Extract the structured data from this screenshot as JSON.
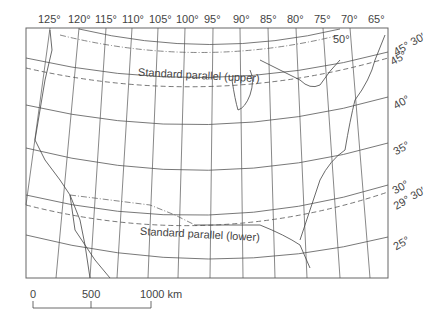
{
  "map": {
    "title": "Albers equal-area conic projection of the conterminous United States",
    "longitude_labels": [
      "125°",
      "120°",
      "115°",
      "110°",
      "105°",
      "100°",
      "95°",
      "90°",
      "85°",
      "80°",
      "75°",
      "70°",
      "65°"
    ],
    "latitude_labels": [
      {
        "text": "50°",
        "x": 333,
        "y": 40
      },
      {
        "text": "45° 30′",
        "x": 395,
        "y": 48
      },
      {
        "text": "45°",
        "x": 392,
        "y": 58
      },
      {
        "text": "40°",
        "x": 393,
        "y": 102
      },
      {
        "text": "35°",
        "x": 393,
        "y": 148
      },
      {
        "text": "30°",
        "x": 393,
        "y": 188
      },
      {
        "text": "29° 30′",
        "x": 393,
        "y": 197
      },
      {
        "text": "25°",
        "x": 393,
        "y": 243
      }
    ],
    "standard_parallels": {
      "upper": "Standard parallel (upper)",
      "lower": "Standard parallel (lower)"
    }
  },
  "scale_bar": {
    "ticks": [
      "0",
      "500",
      "1000 km"
    ],
    "units": "km"
  },
  "colors": {
    "line": "#555555",
    "frame": "#666666",
    "text": "#444444"
  }
}
